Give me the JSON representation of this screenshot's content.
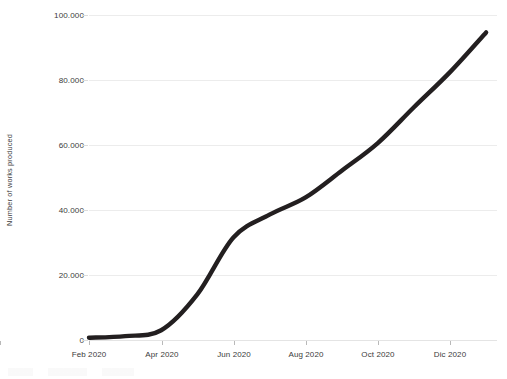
{
  "chart_data": {
    "type": "line",
    "title": "",
    "subtitle": "",
    "xlabel": "",
    "ylabel": "Number of works produced",
    "grid": true,
    "legend": false,
    "legend_position": "none",
    "line_color": "#231f20",
    "gridline_color": "#ececec",
    "axis_text_color": "#3b3b3b",
    "background_color": "#ffffff",
    "xlim_labels": [
      "Feb 2020",
      "Dic 2020"
    ],
    "ylim": [
      0,
      100000
    ],
    "y_ticks": [
      0,
      20000,
      40000,
      60000,
      80000,
      100000
    ],
    "y_tick_labels": [
      "0",
      "20.000",
      "40.000",
      "60.000",
      "80.000",
      "100.000"
    ],
    "x_ticks": [
      "Feb 2020",
      "Apr 2020",
      "Jun 2020",
      "Aug 2020",
      "Oct 2020",
      "Dic 2020"
    ],
    "x": [
      "Jan 2020",
      "Feb 2020",
      "Mar 2020",
      "Apr 2020",
      "May 2020",
      "Jun 2020",
      "Jul 2020",
      "Aug 2020",
      "Sep 2020",
      "Oct 2020",
      "Nov 2020",
      "Dec 2020",
      "Jan 2021"
    ],
    "series": [
      {
        "name": "Cumulative works produced",
        "values": [
          400,
          700,
          1200,
          3000,
          14000,
          31500,
          38500,
          43800,
          52000,
          60500,
          71500,
          82300,
          94500
        ]
      }
    ],
    "annotations": []
  },
  "axes": {
    "y_title": "Number of works produced",
    "y_tick_labels": [
      "100.000",
      "80.000",
      "60.000",
      "40.000",
      "20.000",
      "0"
    ],
    "x_tick_labels": [
      "Feb 2020",
      "Apr 2020",
      "Jun 2020",
      "Aug 2020",
      "Oct 2020",
      "Dic 2020"
    ]
  }
}
